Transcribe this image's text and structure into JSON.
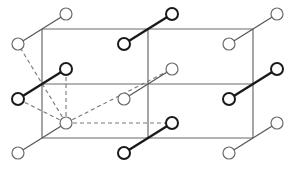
{
  "diagram": {
    "type": "molecular-lattice",
    "grid": {
      "columns": 3,
      "rows": 3
    },
    "molecules": [
      {
        "row": 0,
        "col": 0,
        "style": "thin"
      },
      {
        "row": 0,
        "col": 1,
        "style": "thick"
      },
      {
        "row": 0,
        "col": 2,
        "style": "thin"
      },
      {
        "row": 1,
        "col": 0,
        "style": "thick"
      },
      {
        "row": 1,
        "col": 1,
        "style": "thin"
      },
      {
        "row": 1,
        "col": 2,
        "style": "thick"
      },
      {
        "row": 2,
        "col": 0,
        "style": "thin"
      },
      {
        "row": 2,
        "col": 1,
        "style": "thick"
      },
      {
        "row": 2,
        "col": 2,
        "style": "thin"
      }
    ],
    "interactions": {
      "source": {
        "row": 2,
        "col": 0,
        "end": "upper"
      },
      "targets": [
        {
          "row": 0,
          "col": 0,
          "end": "lower"
        },
        {
          "row": 1,
          "col": 0,
          "end": "upper"
        },
        {
          "row": 1,
          "col": 0,
          "end": "lower"
        },
        {
          "row": 1,
          "col": 1,
          "end": "upper"
        },
        {
          "row": 2,
          "col": 1,
          "end": "upper"
        }
      ]
    }
  }
}
